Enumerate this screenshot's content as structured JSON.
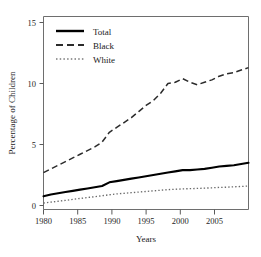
{
  "chart_data": {
    "type": "line",
    "title": "",
    "xlabel": "Years",
    "ylabel": "Percentage of Children",
    "xlim": [
      1980,
      2008
    ],
    "ylim": [
      0,
      15
    ],
    "grid": false,
    "legend_position": "top-left",
    "xticks": [
      1980,
      1985,
      1990,
      1995,
      2000,
      2005
    ],
    "xtick_labels": [
      "1980",
      "1985",
      "1990",
      "1995",
      "2000",
      "2005"
    ],
    "yticks": [
      0,
      5,
      10,
      15
    ],
    "ytick_labels": [
      "0",
      "5",
      "10",
      "15"
    ],
    "x": [
      1980,
      1981,
      1982,
      1983,
      1984,
      1985,
      1986,
      1987,
      1988,
      1989,
      1990,
      1991,
      1992,
      1993,
      1994,
      1995,
      1996,
      1997,
      1998,
      1999,
      2000,
      2001,
      2002,
      2003,
      2004,
      2005,
      2006,
      2007,
      2008
    ],
    "series": [
      {
        "name": "Total",
        "style": "solid",
        "color": "#000000",
        "values": [
          0.75,
          0.9,
          1.0,
          1.1,
          1.2,
          1.3,
          1.4,
          1.5,
          1.6,
          1.9,
          2.0,
          2.1,
          2.2,
          2.3,
          2.4,
          2.5,
          2.6,
          2.7,
          2.8,
          2.9,
          2.9,
          2.95,
          3.0,
          3.1,
          3.2,
          3.25,
          3.3,
          3.4,
          3.5
        ]
      },
      {
        "name": "Black",
        "style": "dashed",
        "color": "#2b2b2b",
        "values": [
          2.7,
          3.0,
          3.3,
          3.6,
          3.9,
          4.2,
          4.5,
          4.8,
          5.2,
          6.0,
          6.4,
          6.8,
          7.2,
          7.7,
          8.2,
          8.6,
          9.2,
          10.0,
          10.1,
          10.4,
          10.1,
          9.9,
          10.1,
          10.3,
          10.6,
          10.8,
          10.9,
          11.1,
          11.3
        ]
      },
      {
        "name": "White",
        "style": "dotted",
        "color": "#6a6a6a",
        "values": [
          0.2,
          0.28,
          0.35,
          0.42,
          0.5,
          0.58,
          0.65,
          0.72,
          0.8,
          0.88,
          0.95,
          1.0,
          1.05,
          1.1,
          1.15,
          1.2,
          1.25,
          1.3,
          1.33,
          1.36,
          1.38,
          1.4,
          1.42,
          1.45,
          1.48,
          1.5,
          1.53,
          1.56,
          1.6
        ]
      }
    ]
  },
  "legend": {
    "entries": [
      {
        "label": "Total"
      },
      {
        "label": "Black"
      },
      {
        "label": "White"
      }
    ]
  }
}
